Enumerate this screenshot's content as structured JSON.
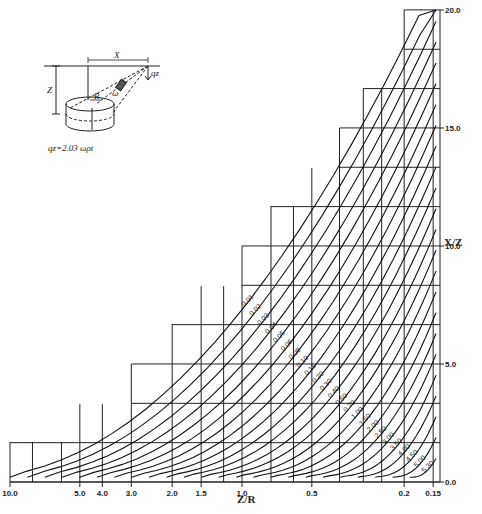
{
  "chart_data": {
    "type": "line",
    "title": "",
    "xlabel": "Z/R",
    "ylabel": "X/Z",
    "x_scale": "log",
    "x_reversed": true,
    "x_ticks": [
      "10.0",
      "5.0",
      "4.0",
      "3.0",
      "2.0",
      "1.5",
      "1.0",
      "0.5",
      "0.2",
      "0.15"
    ],
    "x_tick_values": [
      10.0,
      5.0,
      4.0,
      3.0,
      2.0,
      1.5,
      1.0,
      0.5,
      0.2,
      0.15
    ],
    "y_ticks": [
      "0.0",
      "5.0",
      "10.0",
      "15.0",
      "20.0"
    ],
    "y_tick_values": [
      0,
      5,
      10,
      15,
      20
    ],
    "xlim": [
      10.0,
      0.15
    ],
    "ylim": [
      0,
      20
    ],
    "grid": "staircase grid, 1.0 unit rows",
    "legend_position": "none (curves labeled inline)",
    "series_label": "influence value (q_z / 2.03 ω ρ t)",
    "series": [
      {
        "name": "0.01"
      },
      {
        "name": "0.02"
      },
      {
        "name": "0.03"
      },
      {
        "name": "0.04"
      },
      {
        "name": "0.05"
      },
      {
        "name": "0.06"
      },
      {
        "name": "0.08"
      },
      {
        "name": "0.10"
      },
      {
        "name": "0.15"
      },
      {
        "name": "0.20"
      },
      {
        "name": "0.30"
      },
      {
        "name": "0.40"
      },
      {
        "name": "0.50"
      },
      {
        "name": "0.70"
      },
      {
        "name": "1.00"
      },
      {
        "name": "1.50"
      },
      {
        "name": "2.00"
      },
      {
        "name": "2.50"
      },
      {
        "name": "3.00"
      },
      {
        "name": "3.50"
      },
      {
        "name": "4.00"
      },
      {
        "name": "4.50"
      },
      {
        "name": "5.00"
      },
      {
        "name": "5.30"
      }
    ]
  },
  "inset": {
    "x_label": "X",
    "z_label": "Z",
    "r_label": "R",
    "t_label": "t",
    "omega_label": "ω",
    "qz_label": "qz",
    "formula": "qz=2.03 ωρt"
  }
}
